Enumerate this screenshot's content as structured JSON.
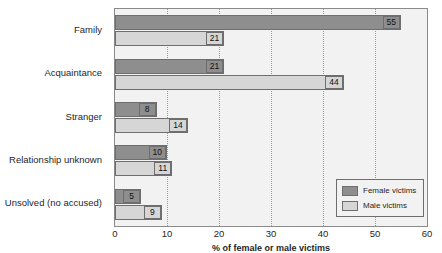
{
  "chart_data": {
    "type": "bar",
    "orientation": "horizontal",
    "title": "",
    "xlabel": "% of female or male victims",
    "ylabel": "",
    "xlim": [
      0,
      60
    ],
    "xticks": [
      0,
      10,
      20,
      30,
      40,
      50,
      60
    ],
    "grid": true,
    "legend_position": "bottom-right",
    "categories": [
      "Family",
      "Acquaintance",
      "Stranger",
      "Relationship unknown",
      "Unsolved (no accused)"
    ],
    "series": [
      {
        "name": "Female victims",
        "color": "#8e8e8e",
        "values": [
          55,
          21,
          8,
          10,
          5
        ]
      },
      {
        "name": "Male victims",
        "color": "#d6d6d6",
        "values": [
          21,
          44,
          14,
          11,
          9
        ]
      }
    ]
  }
}
